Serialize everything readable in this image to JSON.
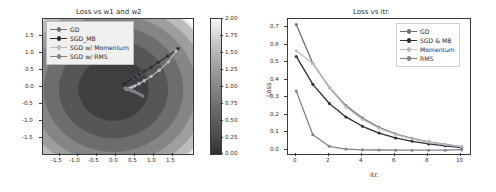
{
  "figure": {
    "width": 496,
    "height": 192,
    "background": "#ffffff"
  },
  "palette": {
    "gd": "#6b6f7a",
    "sgd_mb": "#2e2e33",
    "momentum": "#b9bcc2",
    "rms": "#7e828c",
    "axis": "#3a3a3a",
    "text": "#2b2b2b"
  },
  "chart_data": [
    {
      "id": "contour",
      "type": "heatmap",
      "title": "Loss vs w1 and w2",
      "xlabel": "",
      "ylabel": "",
      "xlim": [
        -2.0,
        2.0
      ],
      "ylim": [
        -2.0,
        2.0
      ],
      "xticks": [
        "-1.5",
        "-1.0",
        "-0.5",
        "0.0",
        "0.5",
        "1.0",
        "1.5"
      ],
      "xtick_values": [
        -1.5,
        -1.0,
        -0.5,
        0.0,
        0.5,
        1.0,
        1.5
      ],
      "yticks": [
        "1.5",
        "1.0",
        "0.5",
        "0.0",
        "-0.5",
        "-1.0",
        "-1.5"
      ],
      "ytick_values": [
        1.5,
        1.0,
        0.5,
        0.0,
        -0.5,
        -1.0,
        -1.5
      ],
      "grid": false,
      "colormap": "gray",
      "colorbar": {
        "vmin": 0.0,
        "vmax": 2.0,
        "ticks": [
          "2.00",
          "1.75",
          "1.50",
          "1.25",
          "1.00",
          "0.75",
          "0.50",
          "0.25",
          "0.00"
        ],
        "tick_values": [
          2.0,
          1.75,
          1.5,
          1.25,
          1.0,
          0.75,
          0.5,
          0.25,
          0.0
        ]
      },
      "contour_levels": [
        0.25,
        0.5,
        0.75,
        1.0,
        1.25,
        1.5,
        1.75,
        2.0
      ],
      "legend_position": "upper left",
      "series": [
        {
          "name": "GD",
          "color": "#6b6f7a",
          "points": [
            [
              1.55,
              1.05
            ],
            [
              1.3,
              0.86
            ],
            [
              1.08,
              0.7
            ],
            [
              0.89,
              0.57
            ],
            [
              0.74,
              0.46
            ],
            [
              0.61,
              0.37
            ],
            [
              0.5,
              0.3
            ],
            [
              0.41,
              0.24
            ],
            [
              0.34,
              0.19
            ],
            [
              0.28,
              0.15
            ],
            [
              0.23,
              0.12
            ]
          ]
        },
        {
          "name": "SGD_MB",
          "color": "#2e2e33",
          "points": [
            [
              1.6,
              1.12
            ],
            [
              1.32,
              0.9
            ],
            [
              1.08,
              0.72
            ],
            [
              0.88,
              0.57
            ],
            [
              0.71,
              0.45
            ],
            [
              0.57,
              0.35
            ],
            [
              0.45,
              0.27
            ],
            [
              0.35,
              0.2
            ],
            [
              0.27,
              0.15
            ],
            [
              0.2,
              0.1
            ],
            [
              0.15,
              0.06
            ]
          ]
        },
        {
          "name": "SGD w/ Momentum",
          "color": "#b9bcc2",
          "points": [
            [
              1.55,
              1.05
            ],
            [
              1.34,
              0.73
            ],
            [
              1.1,
              0.48
            ],
            [
              0.88,
              0.3
            ],
            [
              0.7,
              0.17
            ],
            [
              0.56,
              0.08
            ],
            [
              0.45,
              0.02
            ],
            [
              0.37,
              -0.02
            ],
            [
              0.31,
              -0.05
            ],
            [
              0.26,
              -0.07
            ],
            [
              0.23,
              -0.08
            ]
          ]
        },
        {
          "name": "SGD w/ RMS",
          "color": "#7e828c",
          "points": [
            [
              0.66,
              -0.28
            ],
            [
              0.6,
              -0.24
            ],
            [
              0.54,
              -0.21
            ],
            [
              0.48,
              -0.18
            ],
            [
              0.43,
              -0.15
            ],
            [
              0.38,
              -0.13
            ],
            [
              0.33,
              -0.11
            ],
            [
              0.29,
              -0.09
            ],
            [
              0.25,
              -0.07
            ],
            [
              0.22,
              -0.06
            ],
            [
              0.19,
              -0.05
            ]
          ]
        }
      ],
      "legend": [
        {
          "label": "GD",
          "color": "#6b6f7a"
        },
        {
          "label": "SGD_MB",
          "color": "#2e2e33"
        },
        {
          "label": "SGD w/ Momentum",
          "color": "#b9bcc2"
        },
        {
          "label": "SGD w/ RMS",
          "color": "#7e828c"
        }
      ]
    },
    {
      "id": "loss-curve",
      "type": "line",
      "title": "Loss vs itr.",
      "xlabel": "itr.",
      "ylabel": "Loss",
      "xlim": [
        -0.5,
        10.5
      ],
      "ylim": [
        -0.02,
        0.755
      ],
      "x": [
        0,
        1,
        2,
        3,
        4,
        5,
        6,
        7,
        8,
        9,
        10
      ],
      "xticks": [
        "0",
        "2",
        "4",
        "6",
        "8",
        "10"
      ],
      "xtick_values": [
        0,
        2,
        4,
        6,
        8,
        10
      ],
      "yticks": [
        "0.0",
        "0.1",
        "0.2",
        "0.3",
        "0.4",
        "0.5",
        "0.6",
        "0.7"
      ],
      "ytick_values": [
        0.0,
        0.1,
        0.2,
        0.3,
        0.4,
        0.5,
        0.6,
        0.7
      ],
      "grid": false,
      "legend_position": "upper right",
      "series": [
        {
          "name": "GD",
          "color": "#6b6f7a",
          "values": [
            0.723,
            0.5,
            0.362,
            0.258,
            0.186,
            0.133,
            0.096,
            0.07,
            0.05,
            0.035,
            0.022
          ]
        },
        {
          "name": "SGD & MB",
          "color": "#2e2e33",
          "values": [
            0.54,
            0.38,
            0.27,
            0.193,
            0.139,
            0.1,
            0.072,
            0.053,
            0.038,
            0.027,
            0.017
          ]
        },
        {
          "name": "Momentum",
          "color": "#b9bcc2",
          "values": [
            0.573,
            0.5,
            0.36,
            0.25,
            0.18,
            0.128,
            0.092,
            0.067,
            0.048,
            0.034,
            0.021
          ]
        },
        {
          "name": "RMS",
          "color": "#7e828c",
          "values": [
            0.341,
            0.091,
            0.024,
            0.008,
            0.004,
            0.003,
            0.002,
            0.002,
            0.002,
            0.002,
            0.005
          ]
        }
      ],
      "legend": [
        {
          "label": "GD",
          "color": "#6b6f7a"
        },
        {
          "label": "SGD & MB",
          "color": "#2e2e33"
        },
        {
          "label": "Momentum",
          "color": "#b9bcc2"
        },
        {
          "label": "RMS",
          "color": "#7e828c"
        }
      ]
    }
  ]
}
